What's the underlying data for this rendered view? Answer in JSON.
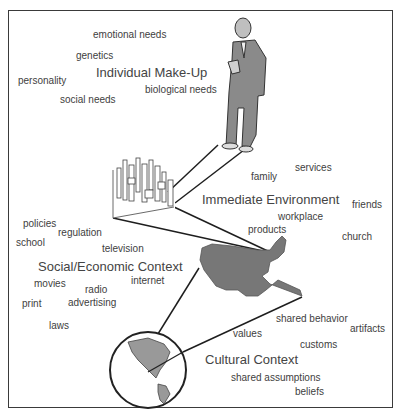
{
  "diagram": {
    "levels": [
      {
        "title": "Individual Make-Up",
        "terms": [
          "emotional needs",
          "genetics",
          "personality",
          "social needs",
          "biological needs"
        ]
      },
      {
        "title": "Immediate Environment",
        "terms": [
          "family",
          "services",
          "friends",
          "workplace",
          "products",
          "church"
        ]
      },
      {
        "title": "Social/Economic Context",
        "terms": [
          "policies",
          "regulation",
          "school",
          "television",
          "internet",
          "movies",
          "radio",
          "print",
          "advertising",
          "laws"
        ]
      },
      {
        "title": "Cultural Context",
        "terms": [
          "shared behavior",
          "artifacts",
          "values",
          "customs",
          "shared assumptions",
          "beliefs"
        ]
      }
    ],
    "images": [
      "person-figure",
      "city-skyline",
      "usa-map",
      "globe"
    ],
    "colors": {
      "text": "#3e3e3e",
      "frame": "#3a3a3a",
      "fill": "#7a7a7a"
    }
  }
}
